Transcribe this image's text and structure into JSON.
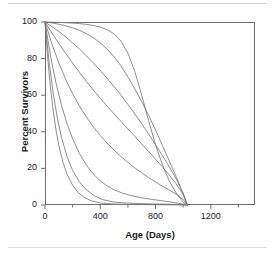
{
  "chart_data": {
    "type": "line",
    "title": "",
    "xlabel": "Age (Days)",
    "ylabel": "Percent Survivors",
    "xlim": [
      0,
      1520
    ],
    "ylim": [
      0,
      100
    ],
    "grid": false,
    "legend": "none",
    "xticks": [
      0,
      400,
      800,
      1200
    ],
    "xtick_labels": [
      "0",
      "400",
      "800",
      "1200"
    ],
    "xminor_ticks": [
      200,
      600,
      1000,
      1400
    ],
    "yticks": [
      0,
      20,
      40,
      60,
      80,
      100
    ],
    "ytick_labels": [
      "0",
      "20",
      "40",
      "60",
      "80",
      "100"
    ],
    "line_color": "#7a7a7a",
    "frame_color": "#6e6e6e",
    "series": [
      {
        "name": "curve-1-rectangular",
        "x": [
          0,
          50,
          100,
          150,
          200,
          250,
          300,
          350,
          400,
          450,
          500,
          550,
          600,
          650,
          700,
          750,
          800,
          850,
          900,
          950,
          1000,
          1030
        ],
        "y": [
          100,
          99.9,
          99.8,
          99.6,
          99.4,
          99.1,
          98.7,
          98.1,
          97.2,
          95.8,
          93.5,
          89.5,
          83,
          73,
          60,
          46,
          33,
          22,
          13,
          6.5,
          1.5,
          0
        ]
      },
      {
        "name": "curve-2",
        "x": [
          0,
          50,
          100,
          150,
          200,
          250,
          300,
          350,
          400,
          450,
          500,
          550,
          600,
          650,
          700,
          750,
          800,
          850,
          900,
          950,
          1000,
          1030
        ],
        "y": [
          100,
          99.5,
          98.8,
          97.9,
          96.8,
          95.4,
          93.6,
          91.4,
          88.6,
          85.2,
          81,
          76,
          70,
          63.5,
          56.5,
          49,
          41,
          32.5,
          24,
          15.5,
          6,
          0
        ]
      },
      {
        "name": "curve-3",
        "x": [
          0,
          50,
          100,
          150,
          200,
          250,
          300,
          350,
          400,
          450,
          500,
          550,
          600,
          650,
          700,
          750,
          800,
          850,
          900,
          950,
          1000,
          1030
        ],
        "y": [
          100,
          97.5,
          94.8,
          91.8,
          88.6,
          85.2,
          81.5,
          77.6,
          73.5,
          69.2,
          64.7,
          60,
          55,
          49.8,
          44.4,
          38.8,
          33,
          27,
          20.8,
          14.2,
          6.5,
          0
        ]
      },
      {
        "name": "curve-4",
        "x": [
          0,
          50,
          100,
          150,
          200,
          250,
          300,
          350,
          400,
          450,
          500,
          550,
          600,
          650,
          700,
          750,
          800,
          850,
          900,
          950,
          1000,
          1030
        ],
        "y": [
          100,
          94,
          88.3,
          82.8,
          77.5,
          72.4,
          67.5,
          62.8,
          58.3,
          54,
          49.8,
          45.7,
          41.6,
          37.5,
          33.4,
          29.3,
          25.1,
          20.8,
          16.3,
          11.5,
          5.8,
          0
        ]
      },
      {
        "name": "curve-5",
        "x": [
          0,
          50,
          100,
          150,
          200,
          250,
          300,
          350,
          400,
          450,
          500,
          550,
          600,
          650,
          700,
          750,
          800,
          850,
          900,
          950,
          1000,
          1030
        ],
        "y": [
          100,
          88,
          77.6,
          68.6,
          60.8,
          54,
          48,
          42.7,
          38,
          33.8,
          30,
          26.5,
          23.3,
          20.3,
          17.6,
          15,
          12.6,
          10.3,
          8.1,
          5.9,
          3,
          0
        ]
      },
      {
        "name": "curve-6",
        "x": [
          0,
          40,
          80,
          120,
          160,
          200,
          250,
          300,
          350,
          400,
          450,
          500,
          560,
          620,
          700,
          780,
          860,
          940,
          1000,
          1030
        ],
        "y": [
          100,
          81.5,
          66.5,
          54.3,
          44.3,
          36.2,
          28,
          21.7,
          16.9,
          13.2,
          10.4,
          8.3,
          6.5,
          5.2,
          3.9,
          3,
          2.2,
          1.3,
          0.5,
          0
        ]
      },
      {
        "name": "curve-7",
        "x": [
          0,
          30,
          60,
          90,
          120,
          160,
          200,
          250,
          300,
          360,
          420,
          500,
          580,
          680,
          780,
          880,
          960,
          1010,
          1030
        ],
        "y": [
          100,
          77.9,
          60.7,
          47.3,
          36.8,
          26.4,
          18.9,
          12.5,
          8.2,
          4.9,
          2.9,
          1.6,
          1.1,
          0.8,
          0.6,
          0.45,
          0.3,
          0.1,
          0
        ]
      },
      {
        "name": "curve-8-exponential",
        "x": [
          0,
          20,
          40,
          60,
          80,
          100,
          130,
          160,
          200,
          240,
          280,
          330,
          400,
          500,
          650,
          800,
          950,
          1030
        ],
        "y": [
          100,
          79.9,
          63.9,
          51,
          40.8,
          32.6,
          23.3,
          16.7,
          10.7,
          6.8,
          4.4,
          2.4,
          1.1,
          0.5,
          0.25,
          0.15,
          0.05,
          0
        ]
      }
    ]
  },
  "axes": {
    "xlabel": "Age (Days)",
    "ylabel": "Percent Survivors"
  }
}
